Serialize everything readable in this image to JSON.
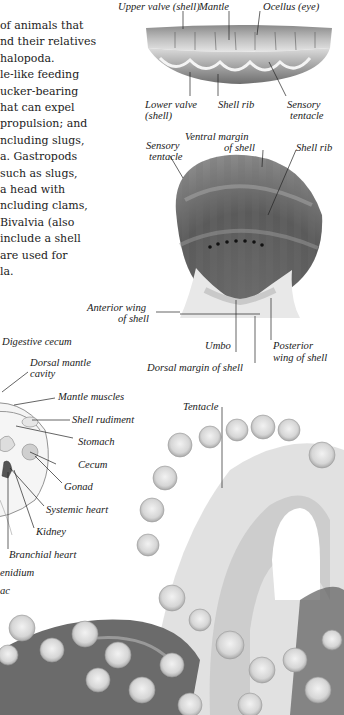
{
  "intro_text": {
    "lines": [
      "of animals that",
      "nd their relatives",
      "halopoda.",
      "le-like feeding",
      "ucker-bearing",
      "hat can expel",
      "propulsion; and",
      "ncluding slugs,",
      "a. Gastropods",
      " such as slugs,",
      " a head with",
      "ncluding clams,",
      "Bivalvia (also",
      "include a shell",
      "are used for",
      "la."
    ]
  },
  "scallop_side_view": {
    "labels": {
      "upper_valve": "Upper valve (shell)",
      "mantle": "Mantle",
      "ocellus": "Ocellus (eye)",
      "lower_valve_1": "Lower valve",
      "lower_valve_2": "(shell)",
      "shell_rib": "Shell rib",
      "sensory_tentacle_1": "Sensory",
      "sensory_tentacle_2": "tentacle"
    }
  },
  "scallop_top_view": {
    "labels": {
      "sensory_tentacle_1": "Sensory",
      "sensory_tentacle_2": "tentacle",
      "ventral_margin_1": "Ventral margin",
      "ventral_margin_2": "of shell",
      "shell_rib": "Shell rib",
      "anterior_wing_1": "Anterior wing",
      "anterior_wing_2": "of shell",
      "umbo": "Umbo",
      "posterior_wing_1": "Posterior",
      "posterior_wing_2": "wing of shell",
      "dorsal_margin": "Dorsal margin of shell"
    }
  },
  "squid_anatomy": {
    "labels": {
      "digestive_cecum": "Digestive cecum",
      "dorsal_mantle_cavity_1": "Dorsal mantle",
      "dorsal_mantle_cavity_2": "cavity",
      "mantle_muscles": "Mantle muscles",
      "shell_rudiment": "Shell rudiment",
      "stomach": "Stomach",
      "cecum": "Cecum",
      "gonad": "Gonad",
      "systemic_heart": "Systemic heart",
      "kidney": "Kidney",
      "branchial_heart": "Branchial heart",
      "ctenidium": "enidium",
      "ink_sac": "ac"
    }
  },
  "octopus_arm": {
    "labels": {
      "tentacle": "Tentacle"
    }
  }
}
